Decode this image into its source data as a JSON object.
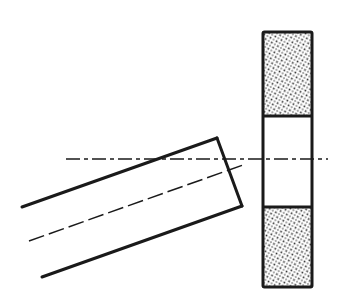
{
  "diagram": {
    "type": "technical-drawing",
    "colors": {
      "background": "#ffffff",
      "line": "#1a1a1a",
      "stipple": "#2a2a2a"
    },
    "wheel": {
      "x": 263,
      "y": 32,
      "width": 49,
      "height": 255,
      "divider_top_y": 116,
      "divider_bottom_y": 207,
      "hatched_sections": [
        "top",
        "bottom"
      ],
      "center_section": "hollow"
    },
    "horizontal_centerline": {
      "x1": 66,
      "y1": 159,
      "x2": 328,
      "y2": 159,
      "style": "dash-dot"
    },
    "tool": {
      "top_edge": {
        "x1": 22,
        "y1": 207,
        "x2": 217,
        "y2": 138
      },
      "end_edge": {
        "x1": 217,
        "y1": 138,
        "x2": 242,
        "y2": 206
      },
      "bottom_edge": {
        "x1": 42,
        "y1": 277,
        "x2": 242,
        "y2": 206
      },
      "axis": {
        "x1": 29,
        "y1": 241,
        "x2": 243,
        "y2": 165,
        "style": "dashed"
      }
    }
  }
}
